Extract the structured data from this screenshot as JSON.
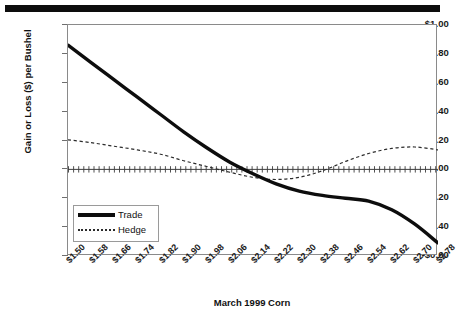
{
  "figure": {
    "top_rule": "black-rule"
  },
  "chart_data": {
    "type": "line",
    "title": "",
    "xlabel": "March 1999 Corn",
    "ylabel": "Gain or Loss ($) per Bushel",
    "ylim": [
      -0.6,
      1.0
    ],
    "ytick_labels": [
      "$1.00",
      "$0.80",
      "$0.60",
      "$0.40",
      "$0.20",
      "$0.00",
      "-$0.20",
      "-$0.40",
      "-$0.60"
    ],
    "ytick_values": [
      1.0,
      0.8,
      0.6,
      0.4,
      0.2,
      0.0,
      -0.2,
      -0.4,
      -0.6
    ],
    "categories": [
      "$1.50",
      "$1.58",
      "$1.66",
      "$1.74",
      "$1.82",
      "$1.90",
      "$1.98",
      "$2.06",
      "$2.14",
      "$2.22",
      "$2.30",
      "$2.38",
      "$2.46",
      "$2.54",
      "$2.62",
      "$2.70",
      "$2.78"
    ],
    "x": [
      1.5,
      1.58,
      1.66,
      1.74,
      1.82,
      1.9,
      1.98,
      2.06,
      2.14,
      2.22,
      2.3,
      2.38,
      2.46,
      2.54,
      2.62,
      2.7,
      2.78
    ],
    "grid": false,
    "legend_position": "inner-lower-left",
    "series": [
      {
        "name": "Trade",
        "style": "thick-solid",
        "color": "#0d0d0d",
        "values": [
          0.86,
          0.74,
          0.62,
          0.5,
          0.38,
          0.26,
          0.15,
          0.05,
          -0.03,
          -0.1,
          -0.15,
          -0.18,
          -0.2,
          -0.22,
          -0.28,
          -0.38,
          -0.51
        ]
      },
      {
        "name": "Hedge",
        "style": "dashed",
        "color": "#2b2b2b",
        "values": [
          0.205,
          0.185,
          0.16,
          0.135,
          0.105,
          0.06,
          0.02,
          -0.02,
          -0.055,
          -0.07,
          -0.055,
          -0.01,
          0.055,
          0.11,
          0.145,
          0.155,
          0.135
        ]
      },
      {
        "name": "Zero Line",
        "style": "tick-markers",
        "color": "#3d3d3d",
        "values": [
          0,
          0,
          0,
          0,
          0,
          0,
          0,
          0,
          0,
          0,
          0,
          0,
          0,
          0,
          0,
          0,
          0
        ]
      }
    ]
  },
  "legend": {
    "items": [
      {
        "label": "Trade"
      },
      {
        "label": "Hedge"
      }
    ]
  }
}
